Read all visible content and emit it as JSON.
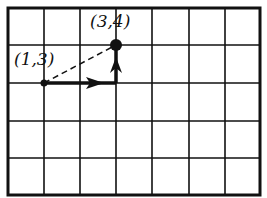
{
  "diagram": {
    "type": "coordinate-grid",
    "grid": {
      "columns": 7,
      "rows": 5
    },
    "points": [
      {
        "label": "(1,3)",
        "x": 1,
        "y": 3
      },
      {
        "label": "(3,4)",
        "x": 3,
        "y": 4
      }
    ],
    "path": [
      {
        "from": "(1,3)",
        "to": "(3,3)",
        "style": "solid-arrow"
      },
      {
        "from": "(3,3)",
        "to": "(3,4)",
        "style": "solid-arrow"
      },
      {
        "from": "(1,3)",
        "to": "(3,4)",
        "style": "dashed"
      }
    ],
    "colors": {
      "ink": "#111111",
      "background": "#ffffff"
    }
  }
}
